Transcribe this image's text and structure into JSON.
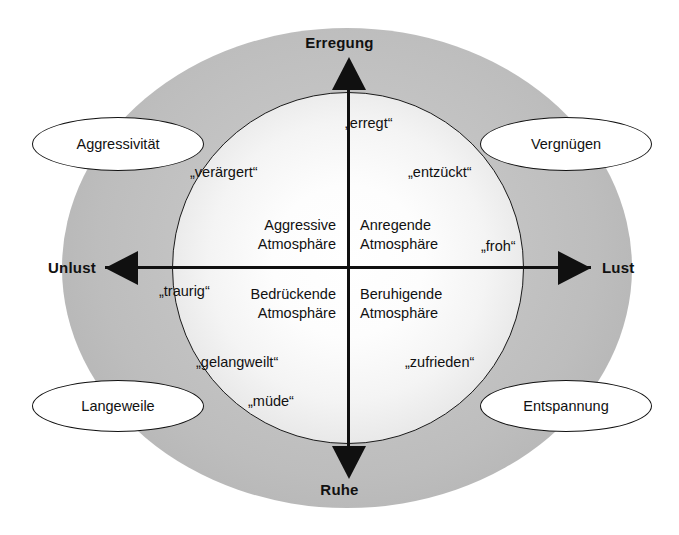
{
  "figure": {
    "title_cropped": "",
    "background_color": "#ffffff",
    "outer_ellipse_color": "#c2c2c2",
    "inner_circle_color": "#ffffff",
    "line_color": "#101010"
  },
  "axes": {
    "top_label": "Erregung",
    "bottom_label": "Ruhe",
    "left_label": "Unlust",
    "right_label": "Lust"
  },
  "quadrants": [
    {
      "id": "upper-left",
      "line1": "Aggressive",
      "line2": "Atmosphäre"
    },
    {
      "id": "upper-right",
      "line1": "Anregende",
      "line2": "Atmosphäre"
    },
    {
      "id": "lower-left",
      "line1": "Bedrückende",
      "line2": "Atmosphäre"
    },
    {
      "id": "lower-right",
      "line1": "Beruhigende",
      "line2": "Atmosphäre"
    }
  ],
  "emotions": [
    {
      "id": "erregt",
      "label": "„erregt“"
    },
    {
      "id": "veraergert",
      "label": "„verärgert“"
    },
    {
      "id": "entzueckt",
      "label": "„entzückt“"
    },
    {
      "id": "froh",
      "label": "„froh“"
    },
    {
      "id": "traurig",
      "label": "„traurig“"
    },
    {
      "id": "gelangweilt",
      "label": "„gelangweilt“"
    },
    {
      "id": "zufrieden",
      "label": "„zufrieden“"
    },
    {
      "id": "muede",
      "label": "„müde“"
    }
  ],
  "callouts": [
    {
      "id": "aggressivitaet",
      "label": "Aggressivität",
      "position": "upper-left"
    },
    {
      "id": "vergnuegen",
      "label": "Vergnügen",
      "position": "upper-right"
    },
    {
      "id": "langeweile",
      "label": "Langeweile",
      "position": "lower-left"
    },
    {
      "id": "entspannung",
      "label": "Entspannung",
      "position": "lower-right"
    }
  ],
  "chart_data": {
    "type": "scatter",
    "title": "",
    "xlabel": "Unlust — Lust",
    "ylabel": "Ruhe — Erregung",
    "xlim": [
      -1,
      1
    ],
    "ylim": [
      -1,
      1
    ],
    "grid": false,
    "legend": "none",
    "axis_poles": {
      "x_negative": "Unlust",
      "x_positive": "Lust",
      "y_negative": "Ruhe",
      "y_positive": "Erregung"
    },
    "quadrant_labels": [
      {
        "quadrant": "x-,y+",
        "label": "Aggressive Atmosphäre"
      },
      {
        "quadrant": "x+,y+",
        "label": "Anregende Atmosphäre"
      },
      {
        "quadrant": "x-,y-",
        "label": "Bedrückende Atmosphäre"
      },
      {
        "quadrant": "x+,y-",
        "label": "Beruhigende Atmosphäre"
      }
    ],
    "points": [
      {
        "label": "„erregt“",
        "x": 0.02,
        "y": 0.87
      },
      {
        "label": "„entzückt“",
        "x": 0.45,
        "y": 0.62
      },
      {
        "label": "„froh“",
        "x": 0.88,
        "y": 0.16
      },
      {
        "label": "„zufrieden“",
        "x": 0.43,
        "y": -0.52
      },
      {
        "label": "„müde“",
        "x": -0.14,
        "y": -0.75
      },
      {
        "label": "„gelangweilt“",
        "x": -0.43,
        "y": -0.52
      },
      {
        "label": "„traurig“",
        "x": -0.88,
        "y": -0.1
      },
      {
        "label": "„verärgert“",
        "x": -0.48,
        "y": 0.6
      }
    ],
    "callouts": [
      {
        "label": "Aggressivität",
        "x": -0.8,
        "y": 0.68
      },
      {
        "label": "Vergnügen",
        "x": 0.8,
        "y": 0.68
      },
      {
        "label": "Langeweile",
        "x": -0.8,
        "y": -0.66
      },
      {
        "label": "Entspannung",
        "x": 0.8,
        "y": -0.66
      }
    ]
  }
}
